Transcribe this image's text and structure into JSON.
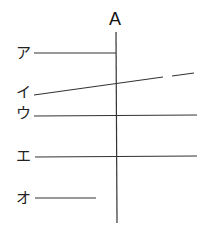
{
  "diagram": {
    "title": "A",
    "labels": [
      "ア",
      "イ",
      "ウ",
      "エ",
      "オ"
    ],
    "lines": [
      {
        "label": "ア",
        "type": "horizontal",
        "y": 53,
        "x1": 34,
        "x2": 116
      },
      {
        "label": "イ",
        "type": "sloped",
        "from": [
          34,
          95
        ],
        "to": [
          194,
          73
        ],
        "gap": [
          163,
          172
        ]
      },
      {
        "label": "ウ",
        "type": "horizontal",
        "y": 116,
        "x1": 34,
        "x2": 197
      },
      {
        "label": "エ",
        "type": "horizontal",
        "y": 156,
        "x1": 34,
        "x2": 197
      },
      {
        "label": "オ",
        "type": "horizontal",
        "y": 198,
        "x1": 34,
        "x2": 96
      }
    ],
    "vertical_line": {
      "label": "A",
      "x": 116,
      "y1": 32,
      "y2": 223
    },
    "stroke_color": "#333333"
  }
}
